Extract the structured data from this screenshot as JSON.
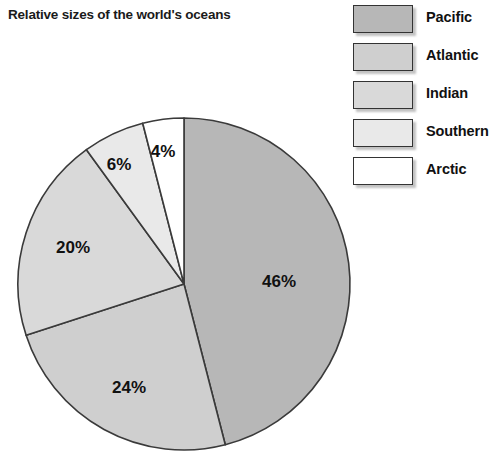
{
  "chart_data": {
    "type": "pie",
    "title": "Relative sizes of the world's oceans",
    "categories": [
      "Pacific",
      "Atlantic",
      "Indian",
      "Southern",
      "Arctic"
    ],
    "values": [
      46,
      24,
      20,
      6,
      4
    ],
    "value_labels": [
      "46%",
      "24%",
      "20%",
      "6%",
      "4%"
    ],
    "unit": "%",
    "colors": [
      "#b7b7b7",
      "#cfcfcf",
      "#d9d9d9",
      "#e9e9e9",
      "#ffffff"
    ],
    "start_angle_deg": 0,
    "direction": "clockwise",
    "legend_position": "right",
    "grid": false,
    "xlabel": "",
    "ylabel": "",
    "slices": [
      {
        "name": "Pacific",
        "value": 46,
        "label": "46%",
        "color": "#b7b7b7"
      },
      {
        "name": "Atlantic",
        "value": 24,
        "label": "24%",
        "color": "#cfcfcf"
      },
      {
        "name": "Indian",
        "value": 20,
        "label": "20%",
        "color": "#d9d9d9"
      },
      {
        "name": "Southern",
        "value": 6,
        "label": "6%",
        "color": "#e9e9e9"
      },
      {
        "name": "Arctic",
        "value": 4,
        "label": "4%",
        "color": "#ffffff"
      }
    ]
  },
  "legend": {
    "items": [
      {
        "label": "Pacific",
        "color": "#b7b7b7"
      },
      {
        "label": "Atlantic",
        "color": "#cfcfcf"
      },
      {
        "label": "Indian",
        "color": "#d9d9d9"
      },
      {
        "label": "Southern",
        "color": "#e9e9e9"
      },
      {
        "label": "Arctic",
        "color": "#ffffff"
      }
    ]
  },
  "geometry": {
    "center_x": 184,
    "center_y": 284,
    "radius": 166,
    "label_positions": [
      {
        "x": 279,
        "y": 283
      },
      {
        "x": 129,
        "y": 389
      },
      {
        "x": 73,
        "y": 249
      },
      {
        "x": 119,
        "y": 166
      },
      {
        "x": 163,
        "y": 153
      }
    ]
  }
}
